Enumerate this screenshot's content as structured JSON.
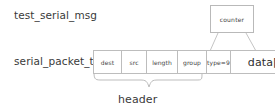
{
  "diagram": {
    "type_labels": {
      "message": "test_serial_msg",
      "packet": "serial_packet_t"
    },
    "counter_box": {
      "label": "counter"
    },
    "packet_fields": [
      {
        "name": "dest",
        "label": "dest"
      },
      {
        "name": "src",
        "label": "src"
      },
      {
        "name": "length",
        "label": "length"
      },
      {
        "name": "group",
        "label": "group"
      },
      {
        "name": "type",
        "label": "type=9"
      },
      {
        "name": "data",
        "label": "data[]"
      }
    ],
    "brace_label": "header",
    "colors": {
      "background": "#ffffff",
      "stroke": "#bdbdbd",
      "text": "#3a3a3a",
      "cell_text": "#444444"
    }
  }
}
